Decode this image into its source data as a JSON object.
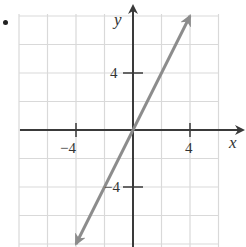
{
  "bullet": "•",
  "chart_data": {
    "type": "line",
    "title": "",
    "xlabel": "x",
    "ylabel": "y",
    "xlim": [
      -8,
      6.8
    ],
    "ylim": [
      -8.1,
      8.1
    ],
    "grid": true,
    "grid_step": 2,
    "x_ticks": [
      -4,
      4
    ],
    "y_ticks": [
      4,
      -4
    ],
    "x_tick_labels": [
      "−4",
      "4"
    ],
    "y_tick_labels": [
      "4",
      "−4"
    ],
    "series": [
      {
        "name": "y = 2x",
        "equation": "y = 2x",
        "slope": 2,
        "intercept": 0,
        "x": [
          -3.05,
          3.05
        ],
        "y": [
          -6.1,
          6.1
        ],
        "arrows_both_ends": true,
        "color": "#8c8c8c"
      }
    ]
  },
  "colors": {
    "grid": "#d9d9d9",
    "axis": "#3a3a3a",
    "line": "#8c8c8c",
    "text": "#333333"
  },
  "labels": {
    "x_axis": "x",
    "y_axis": "y",
    "x_tick_neg": "−4",
    "x_tick_pos": "4",
    "y_tick_pos": "4",
    "y_tick_neg": "−4"
  }
}
